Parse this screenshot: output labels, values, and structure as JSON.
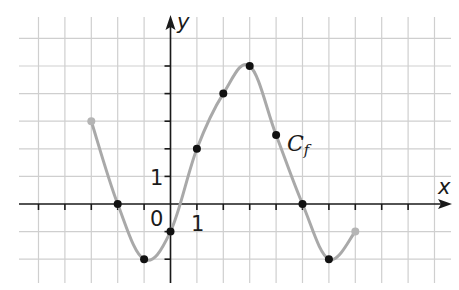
{
  "chart_data": {
    "type": "line",
    "title": "",
    "xlabel": "x",
    "ylabel": "y",
    "curve_label": "C",
    "curve_label_sub": "f",
    "origin_label": "0",
    "x_unit_label": "1",
    "y_unit_label": "1",
    "grid": true,
    "xlim": [
      -5.5,
      10.5
    ],
    "ylim": [
      -3,
      6.3
    ],
    "legend_position": "none",
    "series": [
      {
        "name": "Cf",
        "color": "#a9a9a9",
        "points": [
          {
            "x": -3,
            "y": 3,
            "marker": "gray",
            "endpoint": true
          },
          {
            "x": -2,
            "y": 0,
            "marker": "black"
          },
          {
            "x": -1,
            "y": -2,
            "marker": "black"
          },
          {
            "x": 0,
            "y": -1,
            "marker": "black"
          },
          {
            "x": 1,
            "y": 2,
            "marker": "black"
          },
          {
            "x": 2,
            "y": 4,
            "marker": "black"
          },
          {
            "x": 3,
            "y": 5,
            "marker": "black"
          },
          {
            "x": 4,
            "y": 2.5,
            "marker": "black"
          },
          {
            "x": 5,
            "y": 0,
            "marker": "black"
          },
          {
            "x": 6,
            "y": -2,
            "marker": "black"
          },
          {
            "x": 7,
            "y": -1,
            "marker": "gray",
            "endpoint": true
          }
        ]
      }
    ]
  },
  "colors": {
    "grid": "#cfcfcf",
    "axis": "#1a1a1a",
    "curve": "#a9a9a9",
    "point": "#111111",
    "endpoint": "#b5b5b5"
  }
}
